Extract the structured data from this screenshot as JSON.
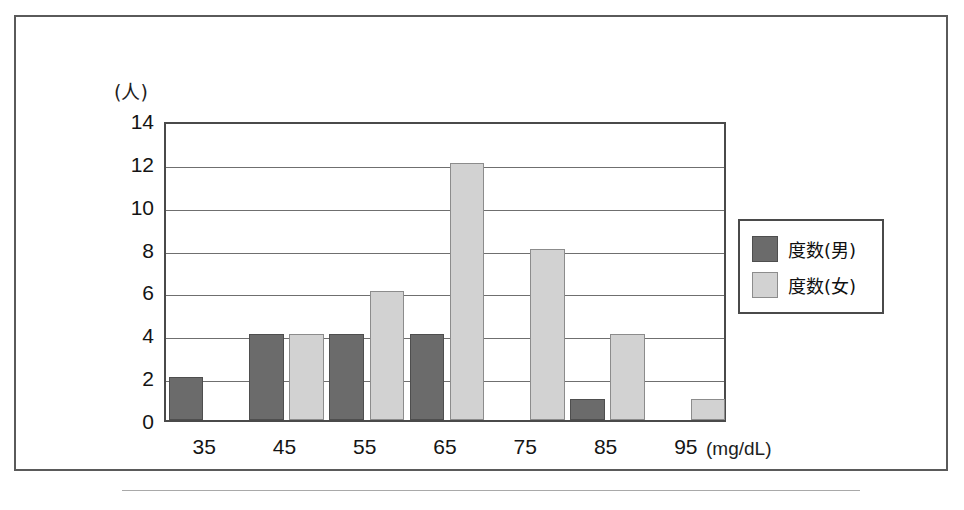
{
  "chart_data": {
    "type": "bar",
    "title": "",
    "subtitle": "",
    "xlabel": "(mg/dL)",
    "ylabel": "(人)",
    "categories": [
      "35",
      "45",
      "55",
      "65",
      "75",
      "85",
      "95"
    ],
    "series": [
      {
        "name": "度数(男)",
        "color": "#6b6b6b",
        "values": [
          2,
          4,
          4,
          4,
          0,
          1,
          0
        ]
      },
      {
        "name": "度数(女)",
        "color": "#d2d2d2",
        "values": [
          0,
          4,
          6,
          12,
          8,
          4,
          1
        ]
      }
    ],
    "ylim": [
      0,
      14
    ],
    "ytick_labels": [
      "14",
      "12",
      "10",
      "8",
      "6",
      "4",
      "2",
      "0"
    ],
    "ytick_values": [
      14,
      12,
      10,
      8,
      6,
      4,
      2,
      0
    ],
    "ystep": 2,
    "grid": true,
    "grid_axis": "y",
    "legend_position": "right",
    "bar_mode": "grouped"
  },
  "axes": {
    "y_unit_caption": "(人)",
    "x_unit_caption": "(mg/dL)"
  },
  "legend": {
    "entries": [
      {
        "label": "度数(男)",
        "swatch": "male-swatch"
      },
      {
        "label": "度数(女)",
        "swatch": "female-swatch"
      }
    ]
  },
  "artifact": {
    "bottom_text": ""
  }
}
